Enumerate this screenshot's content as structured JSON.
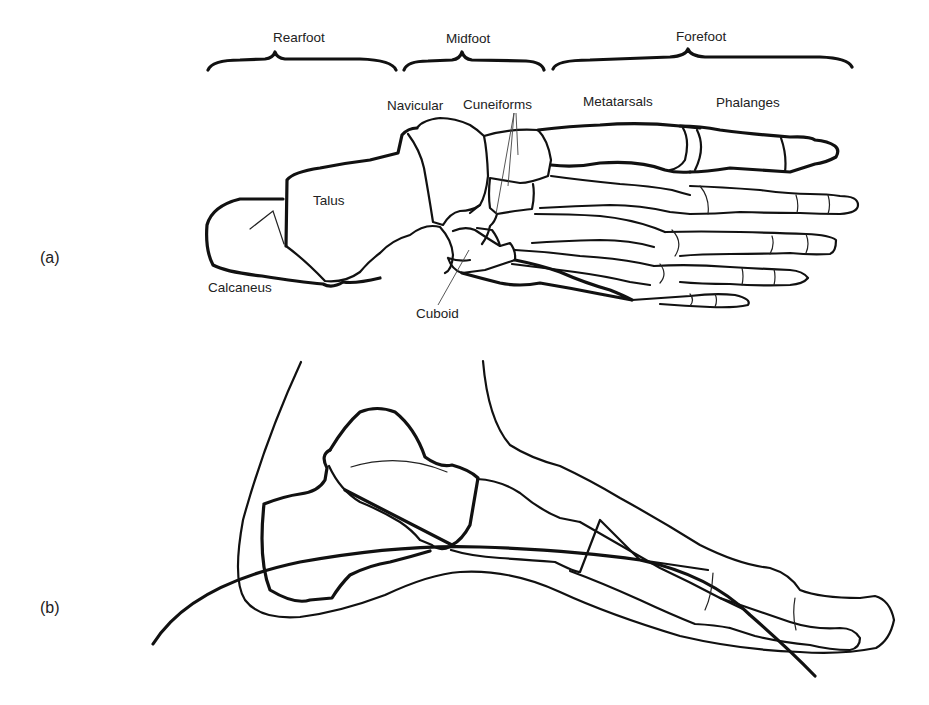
{
  "figure": {
    "panels": [
      {
        "id": "a",
        "label": "(a)",
        "view": "dorsal/superior view of foot skeleton"
      },
      {
        "id": "b",
        "label": "(b)",
        "view": "lateral view of foot with soft-tissue outline"
      }
    ],
    "regions": [
      {
        "name": "Rearfoot"
      },
      {
        "name": "Midfoot"
      },
      {
        "name": "Forefoot"
      }
    ],
    "bone_labels": {
      "navicular": "Navicular",
      "cuneiforms": "Cuneiforms",
      "metatarsals": "Metatarsals",
      "phalanges": "Phalanges",
      "talus": "Talus",
      "calcaneus": "Calcaneus",
      "cuboid": "Cuboid"
    },
    "colors": {
      "line": "#111111",
      "background": "#ffffff",
      "text": "#222222"
    }
  }
}
